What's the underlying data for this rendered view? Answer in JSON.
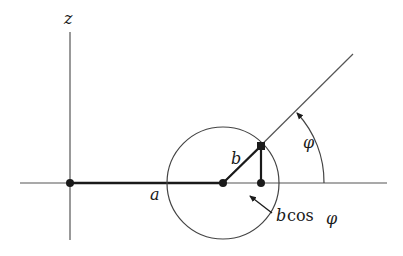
{
  "diagram": {
    "labels": {
      "z_axis": "z",
      "a": "a",
      "b": "b",
      "bcos_b": "b",
      "bcos_cos": "cos",
      "bcos_phi": "φ",
      "phi_angle": "φ"
    },
    "colors": {
      "stroke": "#333333",
      "text": "#1a1a1a",
      "background": "#ffffff"
    }
  }
}
